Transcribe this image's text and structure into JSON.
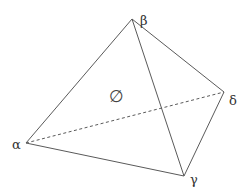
{
  "diagram": {
    "type": "tetrahedron",
    "vertices": [
      {
        "id": "alpha",
        "label": "α"
      },
      {
        "id": "beta",
        "label": "β"
      },
      {
        "id": "gamma",
        "label": "γ"
      },
      {
        "id": "delta",
        "label": "δ"
      }
    ],
    "edges": [
      {
        "from": "alpha",
        "to": "beta",
        "style": "solid"
      },
      {
        "from": "beta",
        "to": "delta",
        "style": "solid"
      },
      {
        "from": "beta",
        "to": "gamma",
        "style": "solid"
      },
      {
        "from": "alpha",
        "to": "gamma",
        "style": "solid"
      },
      {
        "from": "gamma",
        "to": "delta",
        "style": "solid"
      },
      {
        "from": "alpha",
        "to": "delta",
        "style": "dashed"
      }
    ],
    "face_label": "∅"
  }
}
